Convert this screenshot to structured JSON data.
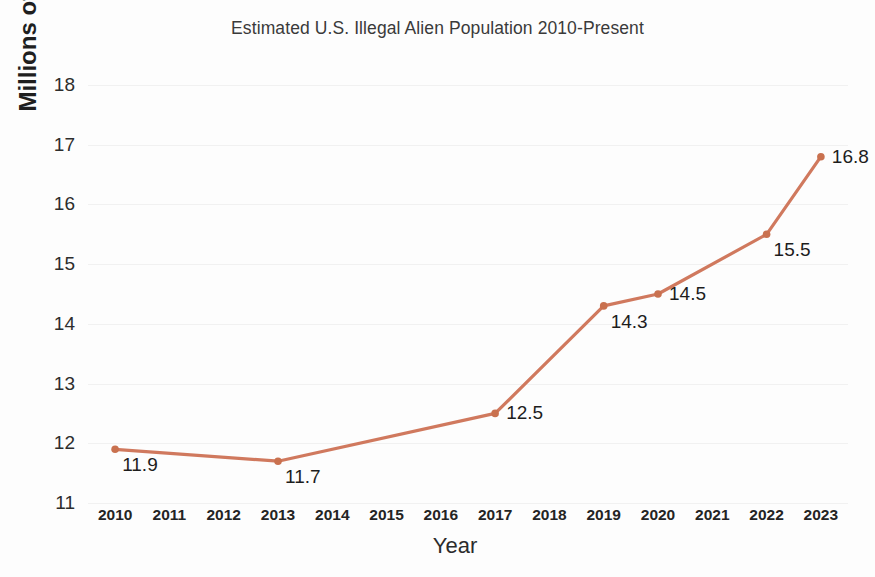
{
  "chart_data": {
    "type": "line",
    "title": "Estimated U.S. Illegal Alien Population 2010-Present",
    "xlabel": "Year",
    "ylabel": "Millions of Illegal Aliens",
    "categories": [
      "2010",
      "2011",
      "2012",
      "2013",
      "2014",
      "2015",
      "2016",
      "2017",
      "2018",
      "2019",
      "2020",
      "2021",
      "2022",
      "2023"
    ],
    "y_ticks": [
      11,
      12,
      13,
      14,
      15,
      16,
      17,
      18
    ],
    "ylim": [
      11,
      18
    ],
    "grid": true,
    "legend": false,
    "series": [
      {
        "name": "Estimated U.S. Illegal Alien Population",
        "color": "#d0795e",
        "points": [
          {
            "x": "2010",
            "y": 11.9,
            "label": "11.9",
            "label_pos": "below-right"
          },
          {
            "x": "2013",
            "y": 11.7,
            "label": "11.7",
            "label_pos": "below-right"
          },
          {
            "x": "2017",
            "y": 12.5,
            "label": "12.5",
            "label_pos": "right"
          },
          {
            "x": "2019",
            "y": 14.3,
            "label": "14.3",
            "label_pos": "below-right"
          },
          {
            "x": "2020",
            "y": 14.5,
            "label": "14.5",
            "label_pos": "right"
          },
          {
            "x": "2022",
            "y": 15.5,
            "label": "15.5",
            "label_pos": "below-right"
          },
          {
            "x": "2023",
            "y": 16.8,
            "label": "16.8",
            "label_pos": "right"
          }
        ]
      }
    ]
  },
  "colors": {
    "series": "#d0795e",
    "marker": "#c9714f",
    "gridline": "#f1f1f1",
    "text": "#2b2b2b",
    "background": "#fdfdfd"
  }
}
